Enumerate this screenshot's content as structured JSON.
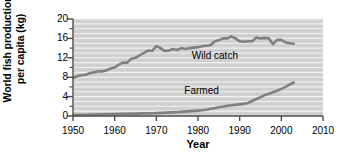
{
  "chart_data": {
    "type": "line",
    "title": "",
    "xlabel": "Year",
    "ylabel": "World fish production per capita (kg)",
    "ylabel_lines": [
      "World fish production",
      "per capita (kg)"
    ],
    "xlim": [
      1950,
      2010
    ],
    "ylim": [
      0,
      20
    ],
    "xticks": [
      1950,
      1960,
      1970,
      1980,
      1990,
      2000,
      2010
    ],
    "yticks": [
      0,
      4,
      8,
      12,
      16,
      20
    ],
    "minor_yticks": [
      2,
      6,
      10,
      14,
      18
    ],
    "grid": "horizontal-gridlines-every-1-unit",
    "legend_position": "inline-annotations",
    "plot_background": "#d0d0d0",
    "gridline_color": "#f2f2f2",
    "line_color": "#808080",
    "axis_color": "#4d4d4d",
    "series": [
      {
        "name": "Wild catch",
        "label_x": 1985,
        "label_y": 12.4,
        "x": [
          1950,
          1951,
          1952,
          1953,
          1954,
          1955,
          1956,
          1957,
          1958,
          1959,
          1960,
          1961,
          1962,
          1963,
          1964,
          1965,
          1966,
          1967,
          1968,
          1969,
          1970,
          1971,
          1972,
          1973,
          1974,
          1975,
          1976,
          1977,
          1978,
          1979,
          1980,
          1981,
          1982,
          1983,
          1984,
          1985,
          1986,
          1987,
          1988,
          1989,
          1990,
          1991,
          1992,
          1993,
          1994,
          1995,
          1996,
          1997,
          1998,
          1999,
          2000,
          2001,
          2002,
          2003
        ],
        "values": [
          7.9,
          8.2,
          8.4,
          8.5,
          8.8,
          9.0,
          9.2,
          9.2,
          9.4,
          9.8,
          10.0,
          10.6,
          11.0,
          11.0,
          11.8,
          12.0,
          12.5,
          13.0,
          13.5,
          13.4,
          14.4,
          14.0,
          13.4,
          13.5,
          13.8,
          13.6,
          14.0,
          13.8,
          14.0,
          14.1,
          14.2,
          14.4,
          14.5,
          14.6,
          15.4,
          15.6,
          16.0,
          16.0,
          16.4,
          16.0,
          15.4,
          15.3,
          15.4,
          15.4,
          16.2,
          16.0,
          16.1,
          16.0,
          14.8,
          15.7,
          15.7,
          15.2,
          15.0,
          14.9
        ]
      },
      {
        "name": "Farmed",
        "label_x": 1982,
        "label_y": 5.2,
        "x": [
          1950,
          1955,
          1960,
          1965,
          1970,
          1975,
          1980,
          1981,
          1982,
          1983,
          1984,
          1985,
          1986,
          1987,
          1988,
          1989,
          1990,
          1991,
          1992,
          1993,
          1994,
          1995,
          1996,
          1997,
          1998,
          1999,
          2000,
          2001,
          2002,
          2003
        ],
        "values": [
          0.2,
          0.3,
          0.4,
          0.5,
          0.6,
          0.8,
          1.1,
          1.2,
          1.3,
          1.5,
          1.6,
          1.8,
          1.9,
          2.1,
          2.2,
          2.3,
          2.4,
          2.5,
          2.7,
          3.1,
          3.5,
          3.9,
          4.3,
          4.6,
          4.9,
          5.2,
          5.6,
          6.0,
          6.5,
          6.9
        ]
      }
    ]
  }
}
